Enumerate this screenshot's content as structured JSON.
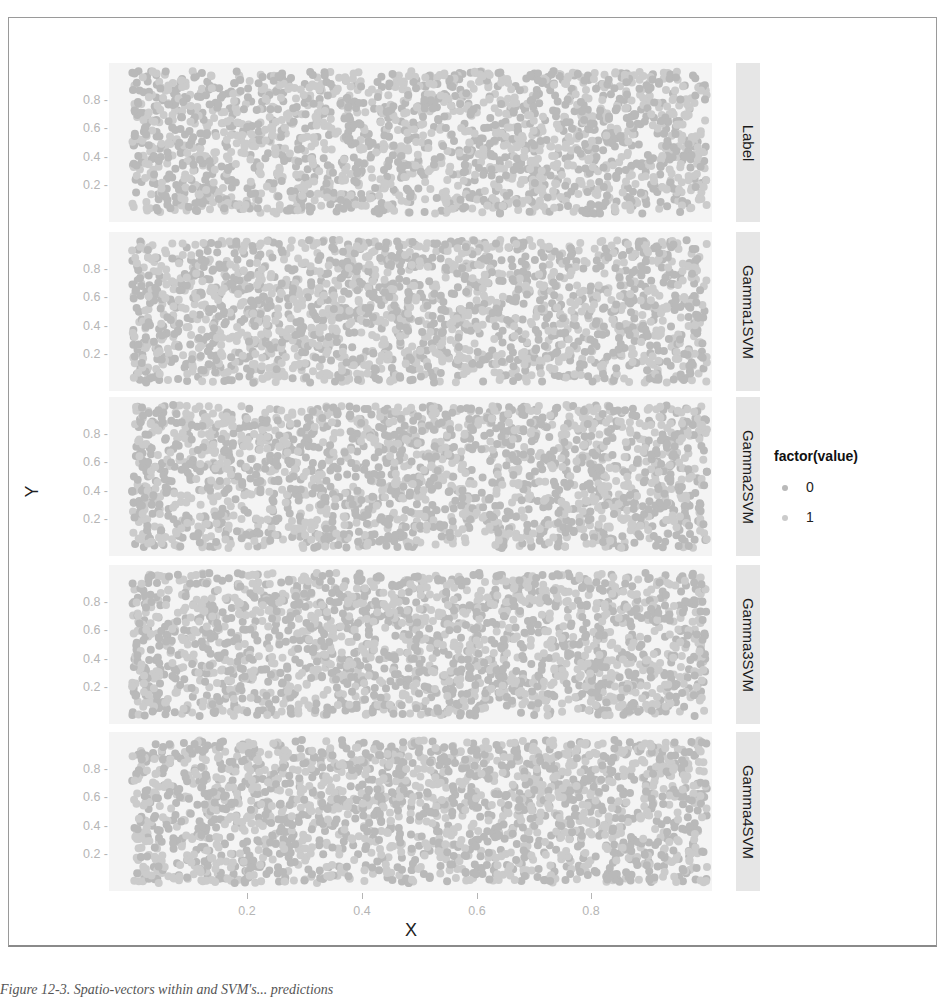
{
  "chart_data": {
    "type": "scatter",
    "title": "",
    "xlabel": "X",
    "ylabel": "Y",
    "xlim": [
      0,
      1
    ],
    "ylim": [
      0,
      1
    ],
    "x_ticks": [
      "0.2",
      "0.4",
      "0.6",
      "0.8"
    ],
    "y_ticks": [
      "0.8",
      "0.6",
      "0.4",
      "0.2"
    ],
    "grid": false,
    "facet_by": "variable",
    "facets": [
      "Label",
      "Gamma1SVM",
      "Gamma2SVM",
      "Gamma3SVM",
      "Gamma4SVM"
    ],
    "legend": {
      "title": "factor(value)",
      "position": "right",
      "entries": [
        {
          "label": "0",
          "color": "#b9b9b9"
        },
        {
          "label": "1",
          "color": "#cbcbcb"
        }
      ]
    },
    "series_description": "Each facet shows ~2000 uniformly distributed random points over [0,1]x[0,1], colored by class 0/1 (nearly indistinguishable grays).",
    "points_per_panel": 2000,
    "point_radius": 4
  },
  "caption": "Figure 12-3. Spatio-vectors within and SVM's... predictions"
}
